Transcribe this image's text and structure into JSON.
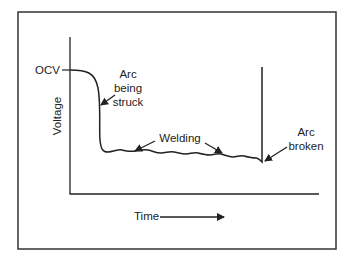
{
  "diagram": {
    "type": "welding arc voltage vs time curve",
    "axes": {
      "x_label": "Time",
      "y_label": "Voltage"
    },
    "labels": {
      "ocv": "OCV",
      "arc_struck": [
        "Arc",
        "being",
        "struck"
      ],
      "welding": "Welding",
      "arc_broken": [
        "Arc",
        "broken"
      ]
    },
    "colors": {
      "line": "#222222",
      "frame": "#333333",
      "background": "#ffffff"
    }
  }
}
